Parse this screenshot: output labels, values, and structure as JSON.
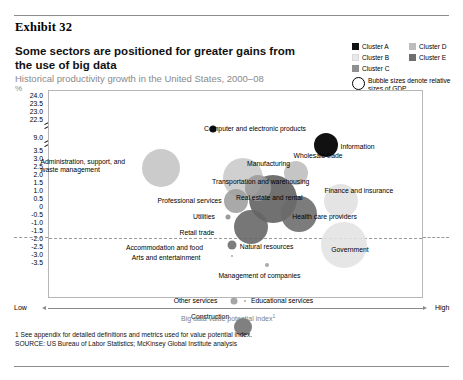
{
  "exhibit": {
    "label": "Exhibit 32"
  },
  "headline": "Some sectors are positioned for greater gains from the use of big data",
  "subhead": "Historical productivity growth in the United States, 2000–08",
  "unit": "%",
  "legend": {
    "items": [
      {
        "label": "Cluster A",
        "color": "#111111"
      },
      {
        "label": "Cluster B",
        "color": "#e3e3e3"
      },
      {
        "label": "Cluster C",
        "color": "#8f8f8f"
      },
      {
        "label": "Cluster D",
        "color": "#bdbdbd"
      },
      {
        "label": "Cluster E",
        "color": "#6e6e6e"
      }
    ],
    "bubble_note": "Bubble sizes denote relative sizes of GDP"
  },
  "axis": {
    "y_title": "%",
    "y_ticks": [
      "24.0",
      "23.5",
      "23.0",
      "22.5",
      "9.0",
      "3.5",
      "3.0",
      "2.5",
      "2.0",
      "1.5",
      "1.0",
      "0.5",
      "0",
      "-0.5",
      "-1.0",
      "-1.5",
      "-2.0",
      "-2.5",
      "-3.0",
      "-3.5"
    ],
    "x_title": "Big data value potential index",
    "x_title_footnote_marker": "1",
    "x_low": "Low",
    "x_high": "High"
  },
  "footnotes": {
    "note1": "1  See appendix for detailed definitions and metrics used for value potential index.",
    "source": "SOURCE:  US Bureau of Labor Statistics; McKinsey Global Institute analysis"
  },
  "chart_data": {
    "type": "scatter",
    "title": "Some sectors are positioned for greater gains from the use of big data",
    "subtitle": "Historical productivity growth in the United States, 2000–08",
    "xlabel": "Big data value potential index",
    "ylabel": "Historical productivity growth, %",
    "ylim": [
      -3.5,
      24.0
    ],
    "y_axis_break_between": [
      9.0,
      22.5
    ],
    "grid": false,
    "legend_position": "top-right",
    "size_encoding": "Bubble sizes denote relative sizes of GDP",
    "points": [
      {
        "name": "Computer and electronic products",
        "x_index": 0.44,
        "y": 4.2,
        "cluster": "Cluster A",
        "color": "#111111",
        "size_px": 7,
        "label_side": "right"
      },
      {
        "name": "Information",
        "x_index": 0.74,
        "y": 3.6,
        "cluster": "Cluster A",
        "color": "#111111",
        "size_px": 24,
        "label_side": "left"
      },
      {
        "name": "Administration, support, and waste management",
        "x_index": 0.3,
        "y": 2.7,
        "cluster": "Cluster D",
        "color": "#c4c4c4",
        "size_px": 38,
        "label_side": "right"
      },
      {
        "name": "Manufacturing",
        "x_index": 0.52,
        "y": 2.3,
        "cluster": "Cluster D",
        "color": "#c9c9c9",
        "size_px": 40,
        "label_side": "right"
      },
      {
        "name": "Wholesale trade",
        "x_index": 0.66,
        "y": 2.5,
        "cluster": "Cluster D",
        "color": "#bdbdbd",
        "size_px": 24,
        "label_side": "right"
      },
      {
        "name": "Transportation and warehousing",
        "x_index": 0.56,
        "y": 1.9,
        "cluster": "Cluster C",
        "color": "#9a9a9a",
        "size_px": 26,
        "label_side": "right"
      },
      {
        "name": "Professional services",
        "x_index": 0.5,
        "y": 1.4,
        "cluster": "Cluster C",
        "color": "#9d9d9d",
        "size_px": 24,
        "label_side": "right"
      },
      {
        "name": "Real estate and rental",
        "x_index": 0.6,
        "y": 1.5,
        "cluster": "Cluster E",
        "color": "#5d5d5d",
        "size_px": 48,
        "label_side": "center"
      },
      {
        "name": "Finance and insurance",
        "x_index": 0.78,
        "y": 1.4,
        "cluster": "Cluster B",
        "color": "#e0e0e0",
        "size_px": 34,
        "label_side": "right"
      },
      {
        "name": "Health care providers",
        "x_index": 0.67,
        "y": 0.9,
        "cluster": "Cluster E",
        "color": "#6a6a6a",
        "size_px": 36,
        "label_side": "left"
      },
      {
        "name": "Utilities",
        "x_index": 0.48,
        "y": 0.8,
        "cluster": "Cluster C",
        "color": "#8d8d8d",
        "size_px": 5,
        "label_side": "right"
      },
      {
        "name": "Retail trade",
        "x_index": 0.54,
        "y": 0.4,
        "cluster": "Cluster E",
        "color": "#646464",
        "size_px": 34,
        "label_side": "right"
      },
      {
        "name": "Government",
        "x_index": 0.79,
        "y": -0.3,
        "cluster": "Cluster B",
        "color": "#e2e2e2",
        "size_px": 46,
        "label_side": "left"
      },
      {
        "name": "Natural resources",
        "x_index": 0.49,
        "y": -0.3,
        "cluster": "Cluster E",
        "color": "#6b6b6b",
        "size_px": 9,
        "label_side": "left"
      },
      {
        "name": "Accommodation and food",
        "x_index": 0.485,
        "y": -0.35,
        "cluster": "Cluster E",
        "color": "#6b6b6b",
        "size_px": 0,
        "label_side": "right"
      },
      {
        "name": "Arts and entertainment",
        "x_index": 0.49,
        "y": -0.75,
        "cluster": "Cluster C",
        "color": "#9d9d9d",
        "size_px": 2,
        "label_side": "right"
      },
      {
        "name": "Management of companies",
        "x_index": 0.585,
        "y": -1.1,
        "cluster": "Cluster C",
        "color": "#9d9d9d",
        "size_px": 4,
        "label_side": "below"
      },
      {
        "name": "Other services",
        "x_index": 0.495,
        "y": -2.5,
        "cluster": "Cluster C",
        "color": "#9a9a9a",
        "size_px": 7,
        "label_side": "right"
      },
      {
        "name": "Educational services",
        "x_index": 0.525,
        "y": -2.5,
        "cluster": "Cluster C",
        "color": "#9d9d9d",
        "size_px": 2,
        "label_side": "left"
      },
      {
        "name": "Construction",
        "x_index": 0.52,
        "y": -3.5,
        "cluster": "Cluster E",
        "color": "#6e6e6e",
        "size_px": 18,
        "label_side": "right"
      }
    ]
  }
}
